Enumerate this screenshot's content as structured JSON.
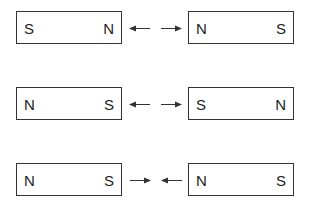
{
  "diagram": {
    "rows": [
      {
        "left_magnet": {
          "left_pole": "S",
          "right_pole": "N"
        },
        "right_magnet": {
          "left_pole": "N",
          "right_pole": "S"
        },
        "arrows": "outward",
        "interaction": "repel"
      },
      {
        "left_magnet": {
          "left_pole": "N",
          "right_pole": "S"
        },
        "right_magnet": {
          "left_pole": "S",
          "right_pole": "N"
        },
        "arrows": "outward",
        "interaction": "repel"
      },
      {
        "left_magnet": {
          "left_pole": "N",
          "right_pole": "S"
        },
        "right_magnet": {
          "left_pole": "N",
          "right_pole": "S"
        },
        "arrows": "inward",
        "interaction": "attract"
      }
    ],
    "colors": {
      "line": "#333333",
      "text": "#222222",
      "background": "#ffffff"
    }
  }
}
